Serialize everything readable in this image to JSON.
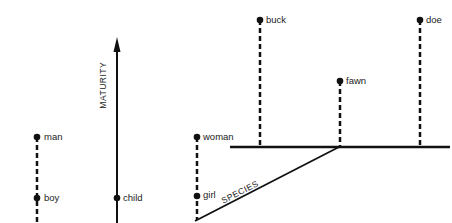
{
  "diagram": {
    "axes": {
      "maturity": "MATURITY",
      "species": "SPECIES"
    },
    "nodes": {
      "man": "man",
      "boy": "boy",
      "child": "child",
      "woman": "woman",
      "girl": "girl",
      "buck": "buck",
      "fawn": "fawn",
      "doe": "doe"
    },
    "colors": {
      "line": "#111111",
      "text": "#222222",
      "background": "#ffffff"
    }
  }
}
